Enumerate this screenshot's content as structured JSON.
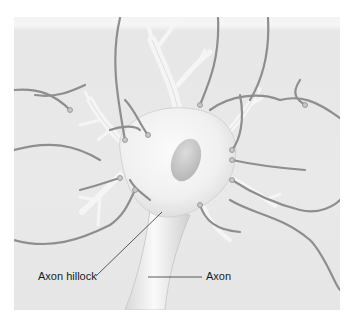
{
  "figure": {
    "background_color": "#e9e9e9",
    "dendrite_color": "#f4f4f4",
    "axon_terminal_color": "#8a8a8a",
    "nucleus_color": "#c9c9c9"
  },
  "labels": {
    "axon_hillock": "Axon hillock",
    "axon": "Axon"
  }
}
